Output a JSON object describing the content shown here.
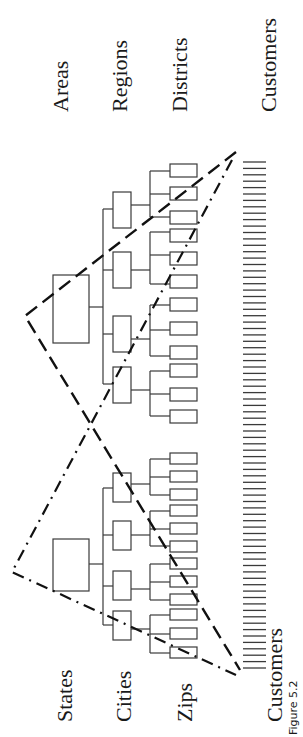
{
  "figure": {
    "caption": "Figure 5.2",
    "colors": {
      "line": "#3a3a3a",
      "text": "#1a1a1a",
      "background": "#ffffff"
    }
  },
  "labels": {
    "areas": "Areas",
    "regions": "Regions",
    "districts": "Districts",
    "customers_top": "Customers",
    "states": "States",
    "cities": "Cities",
    "zips": "Zips",
    "customers_bottom": "Customers"
  },
  "hierarchies": [
    {
      "name": "Sales hierarchy",
      "levels": [
        "Areas",
        "Regions",
        "Districts",
        "Customers"
      ],
      "root_count": 1,
      "child_count": 4,
      "leaf_count_per_child": 3,
      "outline_style": "dashed"
    },
    {
      "name": "Geographic hierarchy",
      "levels": [
        "States",
        "Cities",
        "Zips",
        "Customers"
      ],
      "root_count": 1,
      "child_count": 4,
      "leaf_count_per_child": 3,
      "outline_style": "dash-dot"
    }
  ],
  "customers": {
    "count": 80,
    "note": "shared customer leaf level"
  }
}
